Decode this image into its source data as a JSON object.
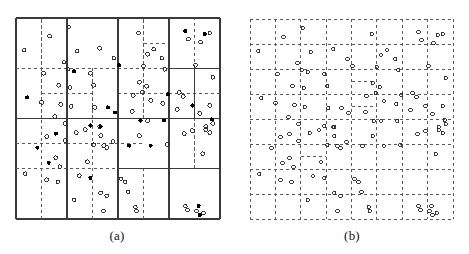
{
  "figure": {
    "background_color": "#ffffff",
    "panels": [
      {
        "id": "a",
        "caption": "(a)",
        "partition_style": "adaptive-quadtree-with-subgrid",
        "frame": {
          "x": 16,
          "y": 18,
          "width": 204,
          "height": 201
        },
        "line_colors": {
          "solid": "#3a3a3a",
          "dashed": "#5a5a5a"
        },
        "point_colors": {
          "open": "#222222",
          "filled": "#000000"
        }
      },
      {
        "id": "b",
        "caption": "(b)",
        "partition_style": "uniform-dashed-grid",
        "frame": {
          "x": 15,
          "y": 19,
          "width": 203,
          "height": 200
        },
        "line_colors": {
          "solid": "#5a5a5a",
          "dashed": "#5a5a5a"
        },
        "point_colors": {
          "open": "#222222",
          "filled": "#000000"
        }
      }
    ]
  },
  "chart_data": {
    "type": "scatter",
    "title": "",
    "subtitle": "",
    "xlabel": "",
    "ylabel": "",
    "xlim": [
      0,
      100
    ],
    "ylim": [
      0,
      100
    ],
    "grid": true,
    "legend_position": "none",
    "annotations": [
      "(a)",
      "(b)"
    ],
    "series": [
      {
        "name": "open-points",
        "marker": "open-circle",
        "color": "#222222",
        "points": [
          [
            16.5,
            91.0
          ],
          [
            26.0,
            95.5
          ],
          [
            4.0,
            84.0
          ],
          [
            30.0,
            83.5
          ],
          [
            13.5,
            72.5
          ],
          [
            23.5,
            78.0
          ],
          [
            25.5,
            74.5
          ],
          [
            41.0,
            85.0
          ],
          [
            48.0,
            80.0
          ],
          [
            36.5,
            72.5
          ],
          [
            60.0,
            92.5
          ],
          [
            64.5,
            82.0
          ],
          [
            67.5,
            84.5
          ],
          [
            71.5,
            80.0
          ],
          [
            62.5,
            76.0
          ],
          [
            73.0,
            74.5
          ],
          [
            84.5,
            89.5
          ],
          [
            90.5,
            88.0
          ],
          [
            95.0,
            92.5
          ],
          [
            88.0,
            76.5
          ],
          [
            96.5,
            70.5
          ],
          [
            21.0,
            66.5
          ],
          [
            26.5,
            65.5
          ],
          [
            12.5,
            58.0
          ],
          [
            22.0,
            57.0
          ],
          [
            27.0,
            56.0
          ],
          [
            19.0,
            51.0
          ],
          [
            24.0,
            47.5
          ],
          [
            38.0,
            66.5
          ],
          [
            38.5,
            55.5
          ],
          [
            41.0,
            46.0
          ],
          [
            60.5,
            68.0
          ],
          [
            64.0,
            66.0
          ],
          [
            62.0,
            63.0
          ],
          [
            57.5,
            61.5
          ],
          [
            66.0,
            59.0
          ],
          [
            57.0,
            53.5
          ],
          [
            72.0,
            57.5
          ],
          [
            64.5,
            49.0
          ],
          [
            80.0,
            63.0
          ],
          [
            82.0,
            61.0
          ],
          [
            79.0,
            54.5
          ],
          [
            90.0,
            52.5
          ],
          [
            95.0,
            56.5
          ],
          [
            96.5,
            47.5
          ],
          [
            93.0,
            46.0
          ],
          [
            15.0,
            41.0
          ],
          [
            24.0,
            39.0
          ],
          [
            29.5,
            43.0
          ],
          [
            19.5,
            30.5
          ],
          [
            21.5,
            26.0
          ],
          [
            34.0,
            44.5
          ],
          [
            41.5,
            41.5
          ],
          [
            38.0,
            37.0
          ],
          [
            43.0,
            36.5
          ],
          [
            44.5,
            35.5
          ],
          [
            47.5,
            38.5
          ],
          [
            35.0,
            28.5
          ],
          [
            60.5,
            41.5
          ],
          [
            74.0,
            37.0
          ],
          [
            82.5,
            42.5
          ],
          [
            86.5,
            44.0
          ],
          [
            93.0,
            44.5
          ],
          [
            95.0,
            43.0
          ],
          [
            91.5,
            32.5
          ],
          [
            4.5,
            22.5
          ],
          [
            15.0,
            19.5
          ],
          [
            20.5,
            18.5
          ],
          [
            31.0,
            21.5
          ],
          [
            28.5,
            9.5
          ],
          [
            41.5,
            13.0
          ],
          [
            44.5,
            11.5
          ],
          [
            43.0,
            4.0
          ],
          [
            51.5,
            20.0
          ],
          [
            53.5,
            18.5
          ],
          [
            55.0,
            13.5
          ],
          [
            58.5,
            6.0
          ],
          [
            59.0,
            4.0
          ],
          [
            83.0,
            6.5
          ],
          [
            84.0,
            4.5
          ],
          [
            88.5,
            4.0
          ],
          [
            92.0,
            3.0
          ]
        ]
      },
      {
        "name": "filled-points",
        "marker": "filled-circle",
        "color": "#000000",
        "points": [
          [
            28.5,
            73.5
          ],
          [
            50.5,
            76.5
          ],
          [
            83.0,
            93.5
          ],
          [
            92.5,
            92.0
          ],
          [
            5.5,
            60.5
          ],
          [
            45.0,
            55.5
          ],
          [
            48.5,
            53.0
          ],
          [
            74.5,
            62.0
          ],
          [
            72.5,
            49.0
          ],
          [
            86.5,
            56.5
          ],
          [
            96.0,
            49.5
          ],
          [
            36.5,
            46.5
          ],
          [
            41.5,
            46.0
          ],
          [
            61.0,
            49.0
          ],
          [
            19.5,
            42.5
          ],
          [
            10.5,
            35.5
          ],
          [
            16.0,
            28.0
          ],
          [
            55.5,
            36.5
          ],
          [
            66.0,
            36.5
          ],
          [
            36.5,
            20.5
          ],
          [
            89.5,
            6.5
          ],
          [
            90.0,
            2.0
          ]
        ]
      }
    ]
  },
  "panel_a": {
    "caption": "(a)",
    "solid_vlines_pct": [
      25,
      50,
      75
    ],
    "solid_hlines_pct": [
      25,
      50,
      75
    ],
    "dashed_vlines_pct": [
      12.5,
      37.5,
      62.5,
      87.5
    ],
    "dashed_hlines_pct": [
      12.5,
      37.5,
      62.5,
      87.5
    ]
  },
  "panel_b": {
    "caption": "(b)",
    "dashed_vlines_pct": [
      12.5,
      25,
      37.5,
      50,
      62.5,
      75,
      87.5
    ],
    "dashed_hlines_pct": [
      12.5,
      25,
      37.5,
      50,
      62.5,
      75,
      87.5
    ]
  }
}
